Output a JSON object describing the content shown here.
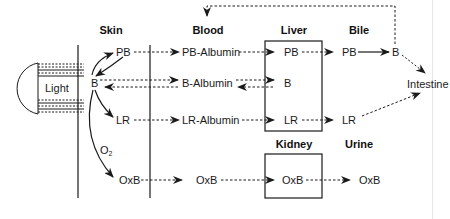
{
  "compartments": {
    "skin": "Skin",
    "blood": "Blood",
    "liver": "Liver",
    "bile": "Bile",
    "kidney": "Kidney",
    "urine": "Urine",
    "intestine": "Intestine"
  },
  "light": {
    "label": "Light"
  },
  "skin_species": {
    "pb": "PB",
    "b": "B",
    "lr": "LR",
    "oxb": "OxB",
    "o2_main": "O",
    "o2_sub": "2"
  },
  "blood_species": {
    "pb_albumin": "PB-Albumin",
    "b_albumin": "B-Albumin",
    "lr_albumin": "LR-Albumin",
    "oxb": "OxB"
  },
  "liver_species": {
    "pb": "PB",
    "b": "B",
    "lr": "LR"
  },
  "bile_species": {
    "pb": "PB",
    "b": "B",
    "lr": "LR"
  },
  "kidney_species": {
    "oxb": "OxB"
  },
  "urine_species": {
    "oxb": "OxB"
  },
  "colors": {
    "ink": "#1a1a1a",
    "background": "#ffffff"
  }
}
